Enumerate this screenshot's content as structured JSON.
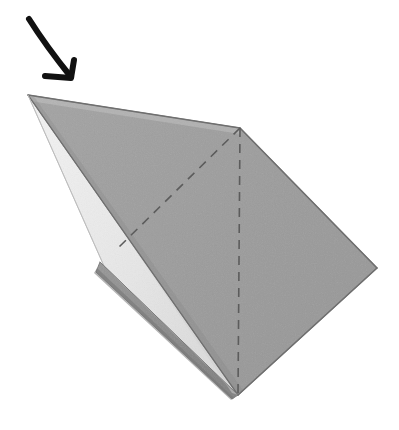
{
  "figure": {
    "description": "A folded sheet of paper seen in three-quarter view with a black instruction arrow pointing down-right toward the upper-left tip, and two dashed valley-fold lines on the gray front face.",
    "canvas": {
      "width": 399,
      "height": 430,
      "background": "#ffffff"
    },
    "colors": {
      "paper_front_gray": "#9c9c9c",
      "paper_front_gray_light": "#a5a5a5",
      "paper_back_white": "#ececec",
      "paper_back_white_shade": "#dedede",
      "paper_under_layer_gray": "#8f8f8f",
      "paper_under_layer_shadow": "#7f7f7f",
      "edge_line": "#777777",
      "dashed_fold_line": "#5c5c5c",
      "arrow": "#111111",
      "page_background": "#ffffff"
    },
    "shapes": [
      {
        "name": "under-layer-flap",
        "role": "hidden-back-flap-gray",
        "fill": "#8f8f8f",
        "points": "100,262 238,395 232,399 96,272"
      },
      {
        "name": "white-back-face",
        "role": "paper-reverse-side",
        "fill": "#ececec",
        "points": "28,95 238,395 104,266"
      },
      {
        "name": "gray-front-face",
        "role": "paper-front-side-main",
        "fill": "#9c9c9c",
        "points": "28,95 240,128 377,268 238,395"
      }
    ],
    "fold_lines": [
      {
        "name": "vertical-valley-fold",
        "style": "dashed",
        "from": [
          240,
          128
        ],
        "to": [
          238,
          395
        ],
        "dash_pattern": "9 7"
      },
      {
        "name": "diagonal-valley-fold",
        "style": "dashed",
        "from": [
          240,
          128
        ],
        "to": [
          118,
          248
        ],
        "dash_pattern": "9 7"
      }
    ],
    "edges": [
      {
        "name": "top-edge",
        "from": [
          28,
          95
        ],
        "to": [
          240,
          128
        ]
      },
      {
        "name": "upper-right-edge",
        "from": [
          240,
          128
        ],
        "to": [
          377,
          268
        ]
      },
      {
        "name": "lower-right-edge",
        "from": [
          377,
          268
        ],
        "to": [
          238,
          395
        ]
      },
      {
        "name": "front-fold-edge",
        "from": [
          28,
          95
        ],
        "to": [
          238,
          395
        ]
      },
      {
        "name": "white-lower-edge",
        "from": [
          28,
          95
        ],
        "to": [
          104,
          266
        ]
      },
      {
        "name": "white-base-edge",
        "from": [
          104,
          266
        ],
        "to": [
          238,
          395
        ]
      },
      {
        "name": "under-layer-edge",
        "from": [
          100,
          262
        ],
        "to": [
          238,
          395
        ]
      }
    ],
    "arrow": {
      "name": "fold-direction-arrow",
      "color": "#111111",
      "stroke_width": 6,
      "shaft_from": [
        29,
        19
      ],
      "shaft_to": [
        71,
        77
      ],
      "head_left": [
        45,
        76
      ],
      "head_right": [
        74,
        60
      ],
      "label": ""
    }
  }
}
